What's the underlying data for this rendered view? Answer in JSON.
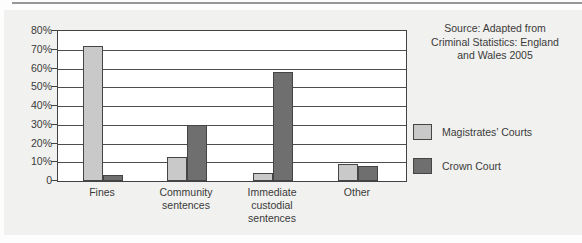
{
  "figure": {
    "source_note": "Source: Adapted from\nCriminal Statistics: England\nand Wales 2005"
  },
  "chart_data": {
    "type": "bar",
    "title": "",
    "xlabel": "",
    "ylabel": "",
    "categories": [
      "Fines",
      "Community sentences",
      "Immediate custodial sentences",
      "Other"
    ],
    "category_label_lines": [
      "Fines",
      "Community\nsentences",
      "Immediate\ncustodial\nsentences",
      "Other"
    ],
    "series": [
      {
        "name": "Magistrates’ Courts",
        "values": [
          72,
          13,
          4,
          9
        ],
        "color": "#c9c9c9"
      },
      {
        "name": "Crown Court",
        "values": [
          3,
          30,
          58,
          8
        ],
        "color": "#6f6f6f"
      }
    ],
    "ylim": [
      0,
      80
    ],
    "ytick_step": 10,
    "ytick_labels": [
      "80%",
      "70%",
      "60%",
      "50%",
      "40%",
      "30%",
      "20%",
      "10%",
      "0"
    ],
    "grid": true,
    "legend_position": "right"
  },
  "colors": {
    "panel_bg": "#f1f1ef",
    "plot_bg": "#ffffff",
    "axis": "#434343",
    "gridline": "#4d4d4d",
    "bar_border": "#454545",
    "text": "#3a3a3a",
    "magistrates_bar": "#c9c9c9",
    "crown_bar": "#6f6f6f"
  }
}
